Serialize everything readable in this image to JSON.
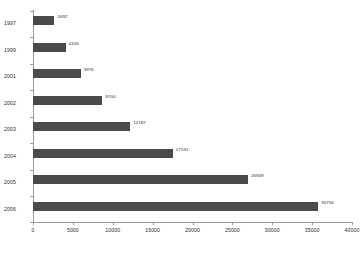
{
  "chart_data": {
    "type": "bar",
    "orientation": "horizontal",
    "title": "",
    "xlabel": "",
    "ylabel": "",
    "categories": [
      "1997",
      "1999",
      "2001",
      "2002",
      "2003",
      "2004",
      "2005",
      "2006"
    ],
    "values": [
      2692,
      4105,
      5976,
      8700,
      12187,
      17531,
      26949,
      35756
    ],
    "data_labels": [
      "2692",
      "4105",
      "5976",
      "8700",
      "12187",
      "17531",
      "26949",
      "35756"
    ],
    "xlim": [
      0,
      40000
    ],
    "xticks": [
      0,
      5000,
      10000,
      15000,
      20000,
      25000,
      30000,
      35000,
      40000
    ],
    "xtick_labels": [
      "0",
      "5000",
      "10000",
      "15000",
      "20000",
      "25000",
      "30000",
      "35000",
      "40000"
    ],
    "grid": false,
    "legend": null,
    "series": [
      {
        "name": "",
        "values": [
          2692,
          4105,
          5976,
          8700,
          12187,
          17531,
          26949,
          35756
        ]
      }
    ],
    "colors": {
      "bar": "#4a4a4a",
      "axis": "#9a9a9a",
      "text": "#2b2b2b",
      "background": "#ffffff"
    }
  }
}
